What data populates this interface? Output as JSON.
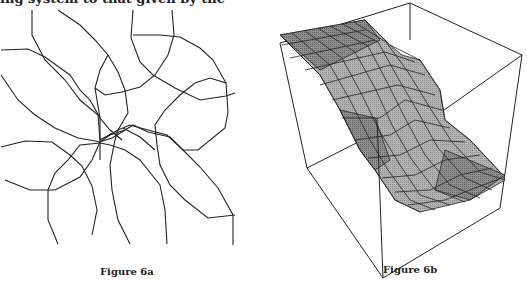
{
  "page": {
    "cropped_top_text": "ing system to that given by the"
  },
  "figures": [
    {
      "id": "6a",
      "caption": "Figure 6a",
      "description": "Overlapping closed polygonal curves (line drawing)"
    },
    {
      "id": "6b",
      "caption": "Figure 6b",
      "description": "3D shaded mesh surface with sigmoidal step inside a wireframe box"
    }
  ],
  "colors": {
    "line": "#222222",
    "surface_dark": "#8a8a8a",
    "surface_mid": "#a8a8a8",
    "surface_light": "#c8c8c8"
  }
}
